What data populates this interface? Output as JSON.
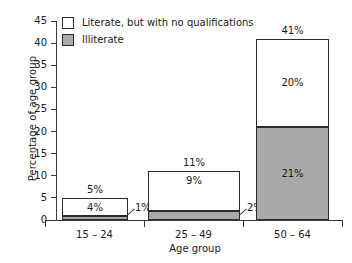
{
  "chart_data": {
    "type": "bar",
    "subtype": "stacked-bar",
    "title": "",
    "xlabel": "Age group",
    "ylabel": "Percentage of age group",
    "categories": [
      "15 – 24",
      "25 – 49",
      "50 – 64"
    ],
    "ylim": [
      0,
      45
    ],
    "yticks": [
      0,
      5,
      10,
      15,
      20,
      25,
      30,
      35,
      40,
      45
    ],
    "ytick_labels": [
      "0",
      "5",
      "10",
      "15",
      "20",
      "25",
      "30",
      "35",
      "40",
      "45"
    ],
    "grid": false,
    "legend_position": "top-left",
    "series": [
      {
        "name": "Illiterate",
        "color": "#a9a9a9",
        "values": [
          1,
          2,
          21
        ],
        "value_labels": [
          "1%",
          "2%",
          "21%"
        ]
      },
      {
        "name": "Literate, but with no qualifications",
        "color": "#ffffff",
        "values": [
          4,
          9,
          20
        ],
        "value_labels": [
          "4%",
          "9%",
          "20%"
        ]
      }
    ],
    "totals": [
      5,
      11,
      41
    ],
    "total_labels": [
      "5%",
      "11%",
      "41%"
    ],
    "annotations": [
      {
        "text": "1%",
        "category": "15 – 24",
        "series": "Illiterate",
        "style": "callout"
      },
      {
        "text": "2%",
        "category": "25 – 49",
        "series": "Illiterate",
        "style": "callout"
      }
    ]
  },
  "legend": {
    "items": [
      {
        "label": "Literate, but with no qualifications",
        "swatch": "#ffffff"
      },
      {
        "label": "Illiterate",
        "swatch": "#a9a9a9"
      }
    ]
  }
}
